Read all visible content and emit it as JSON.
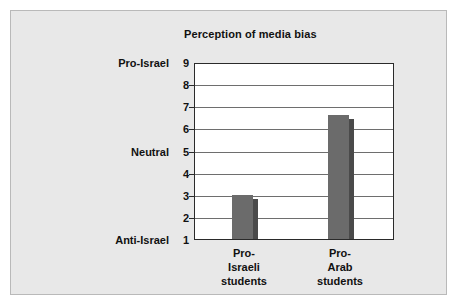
{
  "figure": {
    "title": "Perception of media bias",
    "panel_background": "#e8e8e8",
    "plot_background": "#ffffff",
    "bar_color": "#6b6b6b",
    "bar_shadow_color": "#4a4a4a",
    "axis_color": "#2a2a2a",
    "gridline_color": "#6e6e6e"
  },
  "chart_data": {
    "type": "bar",
    "title": "Perception of media bias",
    "xlabel": "",
    "ylabel": "",
    "categories": [
      "Pro-Israeli students",
      "Pro-Arab students"
    ],
    "category_lines": [
      [
        "Pro-",
        "Israeli",
        "students"
      ],
      [
        "Pro-",
        "Arab",
        "students"
      ]
    ],
    "values": [
      3.0,
      6.6
    ],
    "ylim": [
      1,
      9
    ],
    "yticks": [
      1,
      2,
      3,
      4,
      5,
      6,
      7,
      8,
      9
    ],
    "ytick_labels": [
      "1",
      "2",
      "3",
      "4",
      "5",
      "6",
      "7",
      "8",
      "9"
    ],
    "y_anchor_labels": [
      {
        "value": 9,
        "label": "Pro-Israel"
      },
      {
        "value": 5,
        "label": "Neutral"
      },
      {
        "value": 1,
        "label": "Anti-Israel"
      }
    ],
    "grid": true,
    "legend": false,
    "legend_position": "none"
  }
}
